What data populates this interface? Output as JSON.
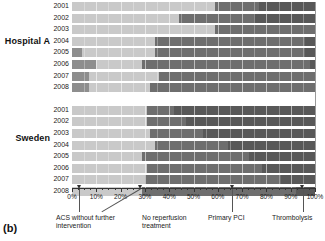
{
  "panel": {
    "label": "(b)"
  },
  "groups": [
    {
      "name": "Hospital A"
    },
    {
      "name": "Sweden"
    }
  ],
  "axis": {
    "ticks": [
      "0%",
      "10%",
      "20%",
      "30%",
      "40%",
      "50%",
      "60%",
      "70%",
      "80%",
      "90%",
      "100%"
    ],
    "min": 0,
    "max": 100
  },
  "annotations": [
    {
      "name": "acs-without-further-intervention",
      "text": "ACS without further\nintervention",
      "target_pct": 3
    },
    {
      "name": "no-reperfusion-treatment",
      "text": "No reperfusion\ntreatment",
      "target_pct": 28
    },
    {
      "name": "primary-pci",
      "text": "Primary PCI",
      "target_pct": 66
    },
    {
      "name": "thrombolysis",
      "text": "Thrombolysis",
      "target_pct": 95
    }
  ],
  "series_colors": {
    "acs_without_further_intervention": "#8e8e8e",
    "no_reperfusion_treatment": "#c9c9c9",
    "primary_pci": "#6e6e6e",
    "thrombolysis": "#585858"
  },
  "chart_data": {
    "type": "bar",
    "orientation": "horizontal",
    "stacked": true,
    "stack_total": 100,
    "title": "",
    "xlabel": "",
    "ylabel": "",
    "xlim": [
      0,
      100
    ],
    "grid": true,
    "legend_position": "annotations-below-axis",
    "series": [
      {
        "name": "ACS without further intervention",
        "color": "#8e8e8e"
      },
      {
        "name": "No reperfusion treatment",
        "color": "#c9c9c9"
      },
      {
        "name": "Primary PCI",
        "color": "#6e6e6e"
      },
      {
        "name": "Thrombolysis",
        "color": "#585858"
      }
    ],
    "groups": [
      {
        "name": "Hospital A",
        "categories": [
          "2001",
          "2002",
          "2003",
          "2004",
          "2005",
          "2006",
          "2007",
          "2008"
        ],
        "rows": [
          {
            "category": "2001",
            "values": [
              0,
              59,
              18,
              23
            ]
          },
          {
            "category": "2002",
            "values": [
              0,
              44,
              31,
              25
            ]
          },
          {
            "category": "2003",
            "values": [
              0,
              59,
              42,
              0
            ]
          },
          {
            "category": "2004",
            "values": [
              0,
              34,
              62,
              4
            ]
          },
          {
            "category": "2005",
            "values": [
              4,
              30,
              62,
              4
            ]
          },
          {
            "category": "2006",
            "values": [
              10,
              19,
              69,
              2
            ]
          },
          {
            "category": "2007",
            "values": [
              7,
              29,
              64,
              0
            ]
          },
          {
            "category": "2008",
            "values": [
              7,
              25,
              68,
              0
            ]
          }
        ]
      },
      {
        "name": "Sweden",
        "categories": [
          "2001",
          "2002",
          "2003",
          "2004",
          "2005",
          "2006",
          "2007",
          "2008"
        ],
        "rows": [
          {
            "category": "2001",
            "values": [
              0,
              31,
              11,
              58
            ]
          },
          {
            "category": "2002",
            "values": [
              0,
              31,
              16,
              53
            ]
          },
          {
            "category": "2003",
            "values": [
              0,
              32,
              22,
              46
            ]
          },
          {
            "category": "2004",
            "values": [
              0,
              34,
              30,
              36
            ]
          },
          {
            "category": "2005",
            "values": [
              0,
              29,
              44,
              27
            ]
          },
          {
            "category": "2006",
            "values": [
              0,
              31,
              47,
              22
            ]
          },
          {
            "category": "2007",
            "values": [
              0,
              30,
              56,
              14
            ]
          },
          {
            "category": "2008",
            "values": [
              0,
              29,
              63,
              8
            ]
          }
        ]
      }
    ]
  }
}
